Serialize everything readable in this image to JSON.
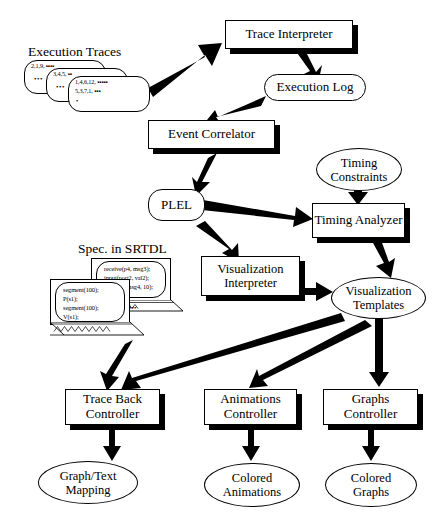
{
  "diagram": {
    "colors": {
      "stroke": "#000000",
      "fill": "#ffffff",
      "shadow": "#000000"
    },
    "labels": {
      "execution_traces": "Execution Traces",
      "spec_in_srtdl": "Spec. in SRTDL"
    },
    "nodes": [
      {
        "id": "trace-interpreter",
        "label": "Trace Interpreter",
        "shape": "rect"
      },
      {
        "id": "execution-log",
        "label": "Execution Log",
        "shape": "rounded"
      },
      {
        "id": "event-correlator",
        "label": "Event Correlator",
        "shape": "rect"
      },
      {
        "id": "plel",
        "label": "PLEL",
        "shape": "rounded"
      },
      {
        "id": "timing-constraints",
        "label": "Timing\nConstraints",
        "shape": "ellipse"
      },
      {
        "id": "timing-analyzer",
        "label": "Timing Analyzer",
        "shape": "rect"
      },
      {
        "id": "visualization-interpreter",
        "label": "Visualization\nInterpreter",
        "shape": "rect"
      },
      {
        "id": "visualization-templates",
        "label": "Visualization\nTemplates",
        "shape": "ellipse"
      },
      {
        "id": "trace-back-controller",
        "label": "Trace Back\nController",
        "shape": "rect"
      },
      {
        "id": "animations-controller",
        "label": "Animations\nController",
        "shape": "rect"
      },
      {
        "id": "graphs-controller",
        "label": "Graphs\nController",
        "shape": "rect"
      },
      {
        "id": "graph-text-mapping",
        "label": "Graph/Text\nMapping",
        "shape": "ellipse"
      },
      {
        "id": "colored-animations",
        "label": "Colored\nAnimations",
        "shape": "ellipse"
      },
      {
        "id": "colored-graphs",
        "label": "Colored\nGraphs",
        "shape": "ellipse"
      }
    ],
    "node_text": {
      "trace_interpreter": "Trace Interpreter",
      "execution_log": "Execution Log",
      "event_correlator": "Event Correlator",
      "plel": "PLEL",
      "timing_constraints_line1": "Timing",
      "timing_constraints_line2": "Constraints",
      "timing_analyzer": "Timing Analyzer",
      "visualization_interpreter_line1": "Visualization",
      "visualization_interpreter_line2": "Interpreter",
      "visualization_templates_line1": "Visualization",
      "visualization_templates_line2": "Templates",
      "trace_back_controller_line1": "Trace Back",
      "trace_back_controller_line2": "Controller",
      "animations_controller_line1": "Animations",
      "animations_controller_line2": "Controller",
      "graphs_controller_line1": "Graphs",
      "graphs_controller_line2": "Controller",
      "graph_text_mapping_line1": "Graph/Text",
      "graph_text_mapping_line2": "Mapping",
      "colored_animations_line1": "Colored",
      "colored_animations_line2": "Animations",
      "colored_graphs_line1": "Colored",
      "colored_graphs_line2": "Graphs"
    },
    "trace_cards": [
      {
        "id": "trace-card-back",
        "lines": "2,1,9,  ▪▪▪▪",
        "dots": "•••"
      },
      {
        "id": "trace-card-middle",
        "lines": "3,4,5,  ▪▪",
        "dots": "•••"
      },
      {
        "id": "trace-card-front-line1",
        "lines": "1,4,6,12,  ▪▪▪▪▪",
        "dots": ""
      },
      {
        "id": "trace-card-front-line2",
        "lines": "5,3,7,1,  ▪▪▪",
        "dots": ""
      }
    ],
    "trace_card_front": {
      "line1": "1,4,6,12,  ▪▪▪▪▪",
      "line2": "5,3,7,1,  ▪▪▪",
      "line3": "•"
    },
    "trace_card_back": {
      "line1": "2,1,9,  ▪▪▪▪",
      "dots": "•••"
    },
    "trace_card_middle": {
      "line1": "3,4,5,  ▪▪",
      "dots": "•••"
    },
    "spec_cards": {
      "back": {
        "line1": "receive(p4, msg3);",
        "line2": "input(port2, val2);",
        "line3": "send(p4, msg4, 10);"
      },
      "front": {
        "line1": "segment(100);",
        "line2": "P(s1);",
        "line3": "segment(100);",
        "line4": "V(s1);"
      },
      "dots": "•••"
    },
    "edges": [
      {
        "from": "execution-traces",
        "to": "trace-interpreter"
      },
      {
        "from": "trace-interpreter",
        "to": "execution-log"
      },
      {
        "from": "execution-log",
        "to": "event-correlator"
      },
      {
        "from": "event-correlator",
        "to": "plel"
      },
      {
        "from": "plel",
        "to": "timing-analyzer"
      },
      {
        "from": "plel",
        "to": "visualization-interpreter"
      },
      {
        "from": "timing-constraints",
        "to": "timing-analyzer"
      },
      {
        "from": "timing-analyzer",
        "to": "visualization-templates"
      },
      {
        "from": "visualization-interpreter",
        "to": "visualization-templates"
      },
      {
        "from": "visualization-templates",
        "to": "trace-back-controller"
      },
      {
        "from": "visualization-templates",
        "to": "animations-controller"
      },
      {
        "from": "visualization-templates",
        "to": "graphs-controller"
      },
      {
        "from": "spec-in-srtdl",
        "to": "trace-back-controller"
      },
      {
        "from": "trace-back-controller",
        "to": "graph-text-mapping"
      },
      {
        "from": "animations-controller",
        "to": "colored-animations"
      },
      {
        "from": "graphs-controller",
        "to": "colored-graphs"
      }
    ]
  }
}
